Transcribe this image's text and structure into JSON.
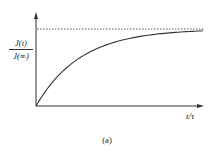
{
  "chart_data": {
    "type": "line",
    "title": "",
    "caption": "(a)",
    "xlabel": "t/τ",
    "ylabel": {
      "numerator": "J(t)",
      "denominator": "J(∞)"
    },
    "grid": false,
    "legend": null,
    "axis_ranges": {
      "x": [
        0,
        5
      ],
      "y": [
        0,
        1.05
      ]
    },
    "asymptote": {
      "y": 1.0,
      "style": "dotted"
    },
    "series": [
      {
        "name": "J(t)/J(∞) = 1 - exp(-t/τ)",
        "x": [
          0,
          0.5,
          1,
          1.5,
          2,
          2.5,
          3,
          3.5,
          4,
          4.5,
          5
        ],
        "values": [
          0,
          0.39,
          0.63,
          0.78,
          0.86,
          0.92,
          0.95,
          0.97,
          0.98,
          0.99,
          0.99
        ]
      }
    ]
  },
  "labels": {
    "x_axis": "t/τ",
    "y_numerator": "J(t)",
    "y_denominator": "J(∞)",
    "caption": "(a)"
  }
}
